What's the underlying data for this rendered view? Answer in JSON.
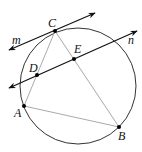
{
  "diagram": {
    "title": "",
    "circle": {
      "cx": 78,
      "cy": 86,
      "r": 58,
      "stroke": "#333333"
    },
    "points": {
      "A": {
        "label": "A",
        "x": 24,
        "y": 106,
        "lx": 14,
        "ly": 117
      },
      "B": {
        "label": "B",
        "x": 119,
        "y": 127,
        "lx": 118,
        "ly": 140
      },
      "C": {
        "label": "C",
        "x": 55,
        "y": 31,
        "lx": 48,
        "ly": 27
      },
      "D": {
        "label": "D",
        "x": 37,
        "y": 75,
        "lx": 29,
        "ly": 72
      },
      "E": {
        "label": "E",
        "x": 74,
        "y": 59,
        "lx": 74,
        "ly": 53
      }
    },
    "segments": [
      {
        "from": "A",
        "to": "C",
        "color": "#aaaaaa"
      },
      {
        "from": "C",
        "to": "B",
        "color": "#aaaaaa"
      },
      {
        "from": "A",
        "to": "B",
        "color": "#aaaaaa"
      }
    ],
    "lines": {
      "m": {
        "label": "m",
        "x1": 9,
        "y1": 50,
        "x2": 95,
        "y2": 13,
        "lx": 12,
        "ly": 44
      },
      "n": {
        "label": "n",
        "x1": 9,
        "y1": 88,
        "x2": 137,
        "y2": 31,
        "lx": 128,
        "ly": 44
      }
    },
    "line_color": "#111111"
  }
}
